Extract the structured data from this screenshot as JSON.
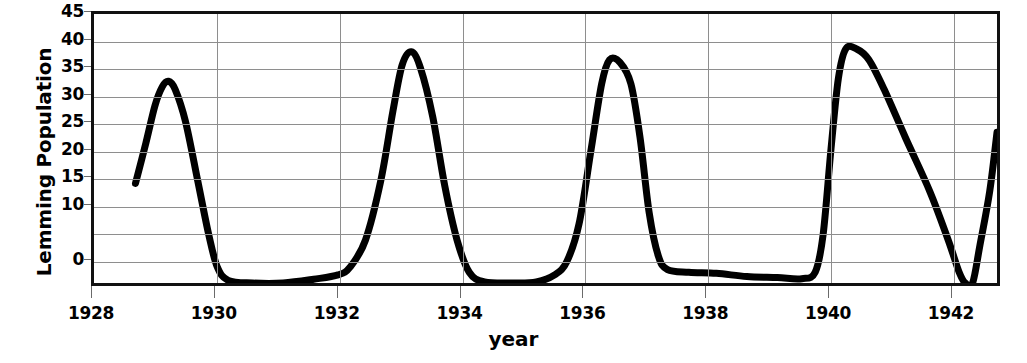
{
  "chart_data": {
    "type": "line",
    "title": "",
    "xlabel": "year",
    "ylabel": "Lemming Population",
    "xlim": [
      1928,
      1942.8
    ],
    "ylim": [
      -5,
      45
    ],
    "grid": true,
    "legend": "none",
    "x_ticks": [
      1928,
      1930,
      1932,
      1934,
      1936,
      1938,
      1940,
      1942
    ],
    "x_tick_labels": [
      "1928",
      "1930",
      "1932",
      "1934",
      "1936",
      "1938",
      "1940",
      "1942"
    ],
    "y_ticks": [
      0,
      10,
      15,
      20,
      25,
      30,
      35,
      40,
      45
    ],
    "y_tick_labels": [
      "0",
      "10",
      "15",
      "20",
      "25",
      "30",
      "35",
      "40",
      "45"
    ],
    "y_gridlines": [
      -5,
      0,
      5,
      10,
      15,
      20,
      25,
      30,
      35,
      40,
      45
    ],
    "line_color": "#000000",
    "line_width": 7,
    "series": [
      {
        "name": "Lemming Population",
        "points": [
          [
            1928.68,
            13.5
          ],
          [
            1928.85,
            21.0
          ],
          [
            1929.0,
            28.0
          ],
          [
            1929.12,
            31.5
          ],
          [
            1929.22,
            32.5
          ],
          [
            1929.33,
            31.0
          ],
          [
            1929.5,
            25.0
          ],
          [
            1929.7,
            14.0
          ],
          [
            1929.88,
            4.0
          ],
          [
            1930.02,
            -2.0
          ],
          [
            1930.2,
            -4.5
          ],
          [
            1930.6,
            -5.0
          ],
          [
            1931.1,
            -5.0
          ],
          [
            1931.6,
            -4.3
          ],
          [
            1932.0,
            -3.5
          ],
          [
            1932.2,
            -2.0
          ],
          [
            1932.45,
            3.0
          ],
          [
            1932.7,
            14.0
          ],
          [
            1932.9,
            27.0
          ],
          [
            1933.05,
            35.5
          ],
          [
            1933.2,
            38.0
          ],
          [
            1933.35,
            35.0
          ],
          [
            1933.55,
            26.0
          ],
          [
            1933.75,
            13.0
          ],
          [
            1933.95,
            3.0
          ],
          [
            1934.15,
            -3.0
          ],
          [
            1934.4,
            -4.8
          ],
          [
            1934.9,
            -5.0
          ],
          [
            1935.25,
            -4.8
          ],
          [
            1935.55,
            -3.5
          ],
          [
            1935.75,
            -1.0
          ],
          [
            1935.95,
            6.0
          ],
          [
            1936.15,
            20.0
          ],
          [
            1936.32,
            32.0
          ],
          [
            1936.45,
            36.5
          ],
          [
            1936.62,
            36.0
          ],
          [
            1936.8,
            32.0
          ],
          [
            1936.95,
            22.0
          ],
          [
            1937.1,
            8.0
          ],
          [
            1937.25,
            0.0
          ],
          [
            1937.4,
            -2.5
          ],
          [
            1937.75,
            -3.0
          ],
          [
            1938.2,
            -3.2
          ],
          [
            1938.7,
            -3.8
          ],
          [
            1939.2,
            -4.0
          ],
          [
            1939.6,
            -4.2
          ],
          [
            1939.82,
            -3.0
          ],
          [
            1939.95,
            4.0
          ],
          [
            1940.08,
            20.0
          ],
          [
            1940.2,
            33.0
          ],
          [
            1940.32,
            38.5
          ],
          [
            1940.5,
            38.5
          ],
          [
            1940.7,
            36.5
          ],
          [
            1940.95,
            31.0
          ],
          [
            1941.3,
            22.0
          ],
          [
            1941.7,
            12.0
          ],
          [
            1942.0,
            3.0
          ],
          [
            1942.18,
            -3.0
          ],
          [
            1942.28,
            -5.0
          ],
          [
            1942.4,
            -5.0
          ],
          [
            1942.52,
            2.0
          ],
          [
            1942.68,
            12.0
          ],
          [
            1942.8,
            23.0
          ]
        ]
      }
    ]
  },
  "axes": {
    "y_title": "Lemming Population",
    "x_title": "year"
  }
}
